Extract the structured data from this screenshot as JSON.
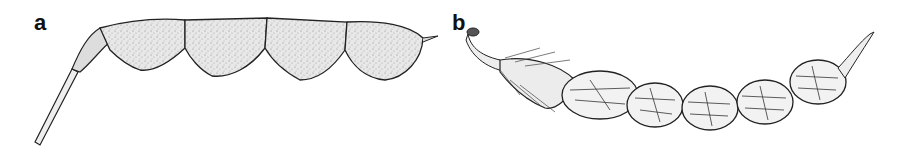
{
  "figure": {
    "panels": [
      {
        "label": "a",
        "subject": "hairy lomentum pod with four rounded segments, stalk and calyx"
      },
      {
        "label": "b",
        "subject": "reticulate-veined lomentum pod with five segments, hairy calyx and curved beak"
      }
    ]
  },
  "colors": {
    "ink": "#1a1a1a",
    "pod_fill": "#e4e4e4",
    "background": "#ffffff"
  }
}
